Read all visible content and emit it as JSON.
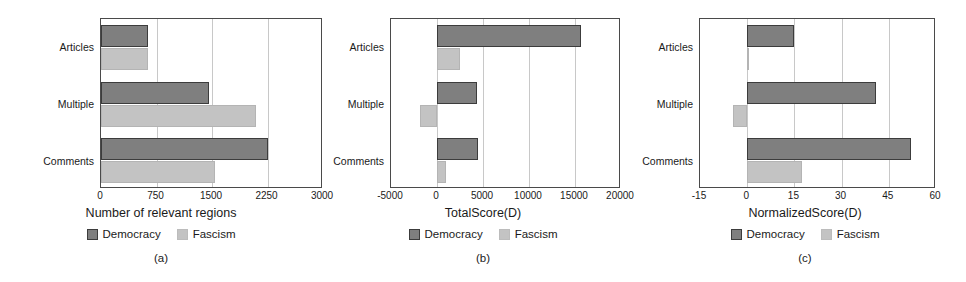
{
  "figure": {
    "panels": [
      {
        "caption": "(a)",
        "chart_data": {
          "type": "bar",
          "orientation": "horizontal",
          "title": "",
          "xlabel": "Number of relevant regions",
          "ylabel": "",
          "categories": [
            "Articles",
            "Multiple",
            "Comments"
          ],
          "xlim": [
            0,
            3000
          ],
          "xticks": [
            0,
            750,
            1500,
            2250,
            3000
          ],
          "xtick_labels": [
            "0",
            "750",
            "1500",
            "2250",
            "3000"
          ],
          "grid": true,
          "legend_position": "below",
          "series": [
            {
              "name": "Democracy",
              "color": "#7f7f7f",
              "values": [
                640,
                1460,
                2250
              ]
            },
            {
              "name": "Fascism",
              "color": "#c3c3c3",
              "values": [
                630,
                2100,
                1540
              ]
            }
          ]
        }
      },
      {
        "caption": "(b)",
        "chart_data": {
          "type": "bar",
          "orientation": "horizontal",
          "title": "",
          "xlabel": "TotalScore(D)",
          "ylabel": "",
          "categories": [
            "Articles",
            "Multiple",
            "Comments"
          ],
          "xlim": [
            -5000,
            20000
          ],
          "xticks": [
            -5000,
            0,
            5000,
            10000,
            15000,
            20000
          ],
          "xtick_labels": [
            "-5000",
            "0",
            "5000",
            "10000",
            "15000",
            "20000"
          ],
          "grid": true,
          "legend_position": "below",
          "series": [
            {
              "name": "Democracy",
              "color": "#7f7f7f",
              "values": [
                15600,
                4400,
                4500
              ]
            },
            {
              "name": "Fascism",
              "color": "#c3c3c3",
              "values": [
                2500,
                -1900,
                1000
              ]
            }
          ]
        }
      },
      {
        "caption": "(c)",
        "chart_data": {
          "type": "bar",
          "orientation": "horizontal",
          "title": "",
          "xlabel": "NormalizedScore(D)",
          "ylabel": "",
          "categories": [
            "Articles",
            "Multiple",
            "Comments"
          ],
          "xlim": [
            -15,
            60
          ],
          "xticks": [
            -15,
            0,
            15,
            30,
            45,
            60
          ],
          "xtick_labels": [
            "-15",
            "0",
            "15",
            "30",
            "45",
            "60"
          ],
          "grid": true,
          "legend_position": "below",
          "series": [
            {
              "name": "Democracy",
              "color": "#7f7f7f",
              "values": [
                15,
                41,
                52
              ]
            },
            {
              "name": "Fascism",
              "color": "#c3c3c3",
              "values": [
                0.4,
                -4.5,
                17.5
              ]
            }
          ]
        }
      }
    ],
    "legend_labels": [
      "Democracy",
      "Fascism"
    ],
    "colors": {
      "democracy": "#7f7f7f",
      "democracy_edge": "#3c3c3c",
      "fascism": "#c3c3c3",
      "fascism_edge": "#bcbcbc",
      "axis": "#4a4a4a",
      "grid": "#c8c8c8",
      "background": "#ffffff"
    }
  }
}
